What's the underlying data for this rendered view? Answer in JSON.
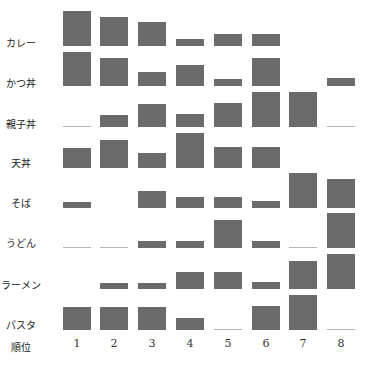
{
  "chart_data": {
    "type": "bar",
    "subtype": "small-multiples rank profile (bar height per rank)",
    "title": "",
    "xlabel": "順位",
    "ylabel": "",
    "categories": [
      "1",
      "2",
      "3",
      "4",
      "5",
      "6",
      "7",
      "8"
    ],
    "grid": false,
    "legend": null,
    "value_unit": "relative bar height (max = 35px)",
    "series": [
      {
        "name": "カレー",
        "values": [
          35,
          29,
          24,
          7,
          12,
          12,
          null,
          null
        ]
      },
      {
        "name": "かつ丼",
        "values": [
          34,
          28,
          14,
          21,
          7,
          28,
          null,
          8
        ]
      },
      {
        "name": "親子丼",
        "values": [
          0,
          12,
          23,
          13,
          24,
          35,
          35,
          0
        ]
      },
      {
        "name": "天丼",
        "values": [
          20,
          28,
          15,
          35,
          21,
          21,
          null,
          null
        ]
      },
      {
        "name": "そば",
        "values": [
          6,
          null,
          17,
          11,
          11,
          7,
          35,
          29
        ]
      },
      {
        "name": "うどん",
        "values": [
          0,
          0,
          7,
          7,
          28,
          7,
          0,
          35
        ]
      },
      {
        "name": "ラーメン",
        "values": [
          null,
          6,
          6,
          17,
          17,
          7,
          28,
          35
        ]
      },
      {
        "name": "パスタ",
        "values": [
          23,
          23,
          23,
          12,
          0,
          24,
          35,
          0
        ]
      }
    ],
    "colors": {
      "bar": "#6b6b6b",
      "zero_line": "#b5b5b5"
    }
  },
  "axis": {
    "x_name": "順位",
    "ticks": [
      "1",
      "2",
      "3",
      "4",
      "5",
      "6",
      "7",
      "8"
    ]
  },
  "rows": [
    {
      "label": "カレー"
    },
    {
      "label": "かつ丼"
    },
    {
      "label": "親子丼"
    },
    {
      "label": "天丼"
    },
    {
      "label": "そば"
    },
    {
      "label": "うどん"
    },
    {
      "label": "ラーメン"
    },
    {
      "label": "パスタ"
    }
  ]
}
